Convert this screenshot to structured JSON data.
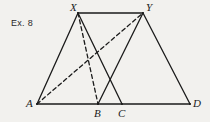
{
  "figure": {
    "caption": "Ex. 8",
    "caption_pos": {
      "x": 11,
      "y": 19
    },
    "canvas": {
      "width": 210,
      "height": 122
    },
    "background_color": "#f2f1ee",
    "ink_color": "#1b1b1b",
    "stroke_width": 1.3,
    "dash_pattern": "4,3",
    "points": [
      {
        "id": "A",
        "label": "A",
        "x": 37,
        "y": 104,
        "label_x": 26,
        "label_y": 98
      },
      {
        "id": "B",
        "label": "B",
        "x": 98,
        "y": 104,
        "label_x": 94,
        "label_y": 108
      },
      {
        "id": "C",
        "label": "C",
        "x": 122,
        "y": 104,
        "label_x": 118,
        "label_y": 108
      },
      {
        "id": "D",
        "label": "D",
        "x": 190,
        "y": 104,
        "label_x": 193,
        "label_y": 98
      },
      {
        "id": "X",
        "label": "X",
        "x": 78,
        "y": 13,
        "label_x": 70,
        "label_y": 2
      },
      {
        "id": "Y",
        "label": "Y",
        "x": 143,
        "y": 13,
        "label_x": 146,
        "label_y": 2
      }
    ],
    "segments": [
      {
        "id": "seg-XY",
        "from": "X",
        "to": "Y",
        "style": "solid"
      },
      {
        "id": "seg-AD",
        "from": "A",
        "to": "D",
        "style": "solid"
      },
      {
        "id": "seg-AX",
        "from": "A",
        "to": "X",
        "style": "solid"
      },
      {
        "id": "seg-XC",
        "from": "X",
        "to": "C",
        "style": "solid"
      },
      {
        "id": "seg-BY",
        "from": "B",
        "to": "Y",
        "style": "solid"
      },
      {
        "id": "seg-YD",
        "from": "Y",
        "to": "D",
        "style": "solid"
      },
      {
        "id": "seg-AY",
        "from": "A",
        "to": "Y",
        "style": "dashed"
      },
      {
        "id": "seg-XB",
        "from": "X",
        "to": "B",
        "style": "dashed"
      }
    ]
  }
}
